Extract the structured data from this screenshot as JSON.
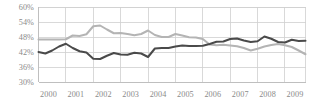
{
  "chart_data": {
    "type": "line",
    "title": "",
    "subtitle": "",
    "xlabel": "",
    "ylabel": "",
    "grid": true,
    "legend": "none",
    "ylim": [
      30,
      60
    ],
    "ytick_labels": [
      "60%",
      "54%",
      "48%",
      "42%",
      "36%",
      "30%"
    ],
    "ytick_values": [
      60,
      54,
      48,
      42,
      36,
      30
    ],
    "xlim": [
      2000,
      2009.75
    ],
    "categories": [
      "2000",
      "2001",
      "2002",
      "2003",
      "2004",
      "2005",
      "2006",
      "2007",
      "2008",
      "2009"
    ],
    "xtick_values": [
      2000,
      2001,
      2002,
      2003,
      2004,
      2005,
      2006,
      2007,
      2008,
      2009
    ],
    "series": [
      {
        "name": "dark-series",
        "color": "#4a4a4a",
        "width": 2.0,
        "x": [
          2000.0,
          2000.25,
          2000.5,
          2000.75,
          2001.0,
          2001.25,
          2001.5,
          2001.75,
          2002.0,
          2002.25,
          2002.5,
          2002.75,
          2003.0,
          2003.25,
          2003.5,
          2003.75,
          2004.0,
          2004.25,
          2004.5,
          2004.75,
          2005.0,
          2005.25,
          2005.5,
          2005.75,
          2006.0,
          2006.25,
          2006.5,
          2006.75,
          2007.0,
          2007.25,
          2007.5,
          2007.75,
          2008.0,
          2008.25,
          2008.5,
          2008.75,
          2009.0,
          2009.25,
          2009.5,
          2009.75
        ],
        "y": [
          42.0,
          41.4,
          42.6,
          44.2,
          45.3,
          43.6,
          42.3,
          41.8,
          39.3,
          39.2,
          40.5,
          41.6,
          41.0,
          40.9,
          41.7,
          41.4,
          40.0,
          43.4,
          43.6,
          43.6,
          44.2,
          44.6,
          44.4,
          44.4,
          44.5,
          45.2,
          46.1,
          46.2,
          47.2,
          47.4,
          46.6,
          46.0,
          46.3,
          48.2,
          47.3,
          46.0,
          45.8,
          46.9,
          46.4,
          46.5
        ]
      },
      {
        "name": "light-series",
        "color": "#b4b4b4",
        "width": 2.0,
        "x": [
          2000.0,
          2000.25,
          2000.5,
          2000.75,
          2001.0,
          2001.25,
          2001.5,
          2001.75,
          2002.0,
          2002.25,
          2002.5,
          2002.75,
          2003.0,
          2003.25,
          2003.5,
          2003.75,
          2004.0,
          2004.25,
          2004.5,
          2004.75,
          2005.0,
          2005.25,
          2005.5,
          2005.75,
          2006.0,
          2006.25,
          2006.5,
          2006.75,
          2007.0,
          2007.25,
          2007.5,
          2007.75,
          2008.0,
          2008.25,
          2008.5,
          2008.75,
          2009.0,
          2009.25,
          2009.5,
          2009.75
        ],
        "y": [
          47.0,
          47.0,
          47.0,
          47.0,
          47.1,
          48.6,
          48.4,
          49.1,
          52.3,
          52.6,
          51.0,
          49.5,
          49.6,
          49.2,
          48.7,
          49.2,
          50.6,
          48.8,
          48.0,
          48.0,
          49.2,
          48.6,
          47.9,
          47.8,
          47.2,
          45.0,
          44.7,
          44.9,
          44.6,
          44.3,
          43.6,
          42.6,
          43.3,
          44.2,
          44.8,
          45.2,
          44.7,
          44.0,
          42.6,
          41.1
        ]
      }
    ]
  }
}
